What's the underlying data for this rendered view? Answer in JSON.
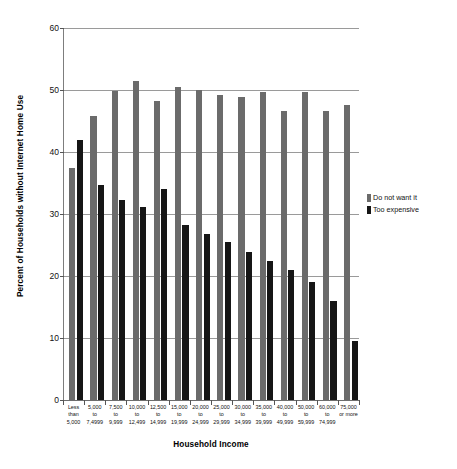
{
  "chart_data": {
    "type": "bar",
    "title": "",
    "xlabel": "Household Income",
    "ylabel": "Percent of Households without Internet Home Use",
    "ylim": [
      0,
      60
    ],
    "yticks": [
      0,
      10,
      20,
      30,
      40,
      50,
      60
    ],
    "ytick_labels": [
      "0",
      "10",
      "20",
      "30",
      "40",
      "50",
      "60"
    ],
    "grid": true,
    "legend_position": "right",
    "categories": [
      "Less than 5,000",
      "5,000 to 7,4999",
      "7,500 to 9,999",
      "10,000 to 12,499",
      "12,500 to 14,999",
      "15,000 to 19,999",
      "20,000 to 24,999",
      "25,000 to 29,999",
      "30,000 to 34,999",
      "35,000 to 39,999",
      "40,000 to 49,999",
      "50,000 to 59,999",
      "60,000 to 74,999",
      "75,000 or more"
    ],
    "category_lines": [
      [
        "Less",
        "than",
        "5,000"
      ],
      [
        "5,000",
        "to",
        "7,4999"
      ],
      [
        "7,500",
        "to",
        "9,999"
      ],
      [
        "10,000",
        "to",
        "12,499"
      ],
      [
        "12,500",
        "to",
        "14,999"
      ],
      [
        "15,000",
        "to",
        "19,999"
      ],
      [
        "20,000",
        "to",
        "24,999"
      ],
      [
        "25,000",
        "to",
        "29,999"
      ],
      [
        "30,000",
        "to",
        "34,999"
      ],
      [
        "35,000",
        "to",
        "39,999"
      ],
      [
        "40,000",
        "to",
        "49,999"
      ],
      [
        "50,000",
        "to",
        "59,999"
      ],
      [
        "60,000",
        "to",
        "74,999"
      ],
      [
        "75,000",
        "or more",
        ""
      ]
    ],
    "series": [
      {
        "name": "Do not want it",
        "color": "#6b6b6b",
        "values": [
          37.5,
          45.8,
          49.8,
          51.4,
          48.3,
          50.5,
          50.0,
          49.2,
          48.8,
          49.6,
          46.6,
          49.6,
          46.6,
          47.6
        ]
      },
      {
        "name": "Too expensive",
        "color": "#161616",
        "values": [
          42.0,
          34.7,
          32.2,
          31.2,
          34.0,
          28.3,
          26.7,
          25.5,
          23.9,
          22.4,
          21.0,
          19.0,
          15.9,
          9.5
        ]
      }
    ]
  },
  "legend": {
    "items": [
      {
        "label": "Do not want it",
        "color": "#6b6b6b"
      },
      {
        "label": "Too expensive",
        "color": "#161616"
      }
    ]
  }
}
